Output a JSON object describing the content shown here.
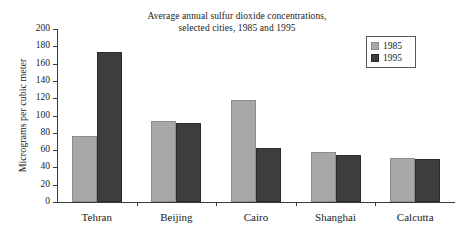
{
  "chart_data": {
    "type": "bar",
    "title": "Average annual sulfur dioxide concentrations, selected cities, 1985 and 1995",
    "title_lines": [
      "Average annual sulfur dioxide concentrations,",
      "selected cities, 1985 and 1995"
    ],
    "xlabel": "",
    "ylabel": "Micrograms per cubic meter",
    "categories": [
      "Tehran",
      "Beijing",
      "Cairo",
      "Shanghai",
      "Calcutta"
    ],
    "series": [
      {
        "name": "1985",
        "color": "#a8a8a8",
        "values": [
          76,
          94,
          118,
          58,
          51
        ]
      },
      {
        "name": "1995",
        "color": "#3d3d3d",
        "values": [
          173,
          91,
          63,
          54,
          50
        ]
      }
    ],
    "ylim": [
      0,
      200
    ],
    "ytick_values": [
      0,
      20,
      40,
      60,
      80,
      100,
      120,
      140,
      160,
      180,
      200
    ],
    "ytick_labels": [
      "0",
      "20",
      "40",
      "60",
      "80",
      "100",
      "120",
      "140",
      "160",
      "180",
      "200"
    ],
    "grid": false,
    "legend_position": "top-right",
    "legend_entries": [
      "1985",
      "1995"
    ]
  },
  "colors": {
    "series_1985": "#a8a8a8",
    "series_1995": "#3d3d3d",
    "axis": "#3a3a3a",
    "text": "#1a1a1a",
    "background": "#ffffff"
  }
}
